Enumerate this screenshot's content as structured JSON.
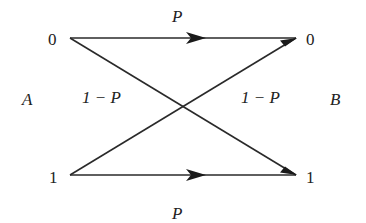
{
  "diagram": {
    "sender_label": "A",
    "receiver_label": "B",
    "nodes": {
      "a0": "0",
      "a1": "1",
      "b0": "0",
      "b1": "1"
    },
    "edges": [
      {
        "from": "a0",
        "to": "b0",
        "label": "P"
      },
      {
        "from": "a1",
        "to": "b1",
        "label": "P"
      },
      {
        "from": "a0",
        "to": "b1",
        "label": "1 − P"
      },
      {
        "from": "a1",
        "to": "b0",
        "label": "1 − P"
      }
    ],
    "colors": {
      "ink": "#222222"
    }
  }
}
